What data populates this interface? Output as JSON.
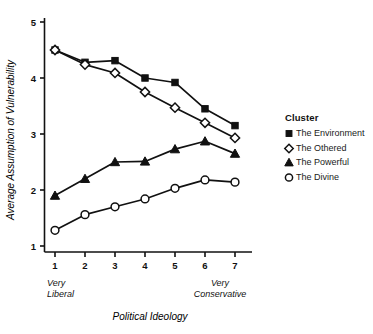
{
  "chart_data": {
    "type": "line",
    "title": "",
    "xlabel": "Political Ideology",
    "ylabel": "Average Assumption of Vulnerability",
    "x": [
      1,
      2,
      3,
      4,
      5,
      6,
      7
    ],
    "xticklabels": [
      "1",
      "2",
      "3",
      "4",
      "5",
      "6",
      "7"
    ],
    "yticklabels": [
      "1",
      "2",
      "3",
      "4",
      "5"
    ],
    "yticks": [
      1,
      2,
      3,
      4,
      5
    ],
    "xlim": [
      0.7,
      7.4
    ],
    "ylim": [
      0.75,
      5.15
    ],
    "grid": false,
    "legend_position": "right",
    "legend_title": "Cluster",
    "x_axis_end_labels": [
      {
        "at": 1,
        "line1": "Very",
        "line2": "Liberal"
      },
      {
        "at": 6.5,
        "line1": "Very",
        "line2": "Conservative"
      }
    ],
    "series": [
      {
        "name": "The Environment",
        "marker": "filled-square",
        "values": [
          4.5,
          4.28,
          4.31,
          4.0,
          3.92,
          3.45,
          3.15
        ]
      },
      {
        "name": "The Othered",
        "marker": "open-diamond",
        "values": [
          4.5,
          4.24,
          4.09,
          3.75,
          3.47,
          3.2,
          2.93
        ]
      },
      {
        "name": "The Powerful",
        "marker": "filled-triangle",
        "values": [
          1.9,
          2.2,
          2.5,
          2.51,
          2.73,
          2.87,
          2.65
        ]
      },
      {
        "name": "The Divine",
        "marker": "open-circle",
        "values": [
          1.28,
          1.56,
          1.7,
          1.84,
          2.03,
          2.18,
          2.14
        ]
      }
    ]
  },
  "legend": {
    "title": "Cluster",
    "items": [
      {
        "label": "The Environment",
        "marker": "filled-square"
      },
      {
        "label": "The Othered",
        "marker": "open-diamond"
      },
      {
        "label": "The Powerful",
        "marker": "filled-triangle"
      },
      {
        "label": "The Divine",
        "marker": "open-circle"
      }
    ]
  },
  "axes": {
    "x_title": "Political Ideology",
    "y_title": "Average Assumption of Vulnerability",
    "x_left_label_line1": "Very",
    "x_left_label_line2": "Liberal",
    "x_right_label_line1": "Very",
    "x_right_label_line2": "Conservative"
  },
  "colors": {
    "line": "#111111",
    "marker_fill": "#111111",
    "marker_open_fill": "#ffffff",
    "background": "#ffffff",
    "text": "#111111"
  }
}
